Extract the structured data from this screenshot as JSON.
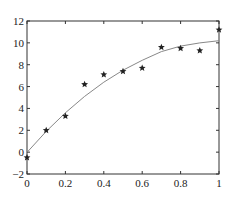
{
  "chart_data": {
    "type": "scatter",
    "title": "",
    "xlabel": "",
    "ylabel": "",
    "xlim": [
      0,
      1
    ],
    "ylim": [
      -2,
      12
    ],
    "grid": false,
    "legend": null,
    "x_ticks": [
      "0",
      "0.2",
      "0.4",
      "0.6",
      "0.8",
      "1"
    ],
    "y_ticks": [
      "-2",
      "0",
      "2",
      "4",
      "6",
      "8",
      "10",
      "12"
    ],
    "series": [
      {
        "name": "data",
        "type": "scatter",
        "marker": "star",
        "x": [
          0,
          0.1,
          0.2,
          0.3,
          0.4,
          0.5,
          0.6,
          0.7,
          0.8,
          0.9,
          1.0
        ],
        "y": [
          -0.5,
          2.0,
          3.3,
          6.2,
          7.1,
          7.4,
          7.7,
          9.6,
          9.5,
          9.3,
          11.2
        ]
      },
      {
        "name": "fit",
        "type": "line",
        "color": "#888888",
        "x": [
          0,
          0.1,
          0.2,
          0.3,
          0.4,
          0.5,
          0.6,
          0.7,
          0.8,
          0.9,
          1.0
        ],
        "y": [
          -0.02,
          1.9,
          3.6,
          5.1,
          6.4,
          7.5,
          8.4,
          9.2,
          9.7,
          10.0,
          10.2
        ]
      }
    ]
  }
}
